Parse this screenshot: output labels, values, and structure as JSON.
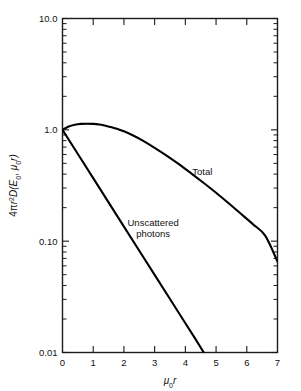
{
  "chart_data": {
    "type": "line",
    "title": "",
    "xlabel": "μ₀r",
    "ylabel": "4πr²D(E₀, μ₀r)",
    "xlim": [
      0,
      7
    ],
    "ylim": [
      0.01,
      10.0
    ],
    "yscale": "log",
    "xscale": "linear",
    "grid": false,
    "legend_position": "inline-annotation",
    "xticks": [
      "0",
      "1",
      "2",
      "3",
      "4",
      "5",
      "6",
      "7"
    ],
    "xtick_values": [
      0,
      1,
      2,
      3,
      4,
      5,
      6,
      7
    ],
    "yticks": [
      "10.0",
      "1.0",
      "0.10",
      "0.01"
    ],
    "ytick_values": [
      10.0,
      1.0,
      0.1,
      0.01
    ],
    "minor_tick_multipliers": [
      2,
      3,
      4,
      5,
      6,
      7,
      8,
      9
    ],
    "series": [
      {
        "name": "Total",
        "label": "Total",
        "label_x": 4.55,
        "label_y": 0.42,
        "x": [
          0,
          0.2,
          0.4,
          0.6,
          0.8,
          1.0,
          1.2,
          1.4,
          1.6,
          1.8,
          2.0,
          2.3,
          2.6,
          3.0,
          3.4,
          3.8,
          4.2,
          4.6,
          5.0,
          5.4,
          5.8,
          6.2,
          6.6,
          7.0
        ],
        "y": [
          1.0,
          1.07,
          1.11,
          1.13,
          1.135,
          1.13,
          1.115,
          1.09,
          1.055,
          1.015,
          0.97,
          0.89,
          0.805,
          0.69,
          0.585,
          0.49,
          0.405,
          0.333,
          0.272,
          0.22,
          0.177,
          0.142,
          0.112,
          0.0655
        ]
      },
      {
        "name": "Unscattered photons",
        "label_line1": "Unscattered",
        "label_line2": "photons",
        "label_x": 2.95,
        "label_y": 0.138,
        "x": [
          0,
          0.5,
          1.0,
          1.5,
          2.0,
          2.5,
          3.0,
          3.5,
          4.0,
          4.3,
          4.6
        ],
        "y": [
          1.0,
          0.607,
          0.368,
          0.223,
          0.135,
          0.0821,
          0.0498,
          0.0302,
          0.0183,
          0.0136,
          0.01
        ]
      }
    ],
    "annotations": [
      {
        "text": "Total",
        "x": 4.55,
        "y": 0.42
      },
      {
        "text": "Unscattered photons",
        "x": 2.95,
        "y": 0.138
      }
    ]
  },
  "axes": {
    "y_axis_title": "4πr²D(E₀, μ₀r)",
    "y_title_parts": {
      "prefix": "4",
      "pi": "π",
      "r": "r",
      "exp": "2",
      "d_open": "D(E",
      "sub0": "0",
      "comma": ", ",
      "mu": "μ",
      "mu_sub": "0",
      "r2": "r)"
    },
    "x_axis_title": "μ₀r",
    "x_title_parts": {
      "mu": "μ",
      "sub": "0",
      "r": "r"
    }
  },
  "labels": {
    "y_10": "10.0",
    "y_1": "1.0",
    "y_01": "0.10",
    "y_001": "0.01",
    "x_0": "0",
    "x_1": "1",
    "x_2": "2",
    "x_3": "3",
    "x_4": "4",
    "x_5": "5",
    "x_6": "6",
    "x_7": "7",
    "curve_total": "Total",
    "curve_unscattered_1": "Unscattered",
    "curve_unscattered_2": "photons"
  },
  "colors": {
    "background": "#ffffff",
    "axis": "#1a1a1a",
    "curve": "#000000",
    "text": "#111111"
  }
}
